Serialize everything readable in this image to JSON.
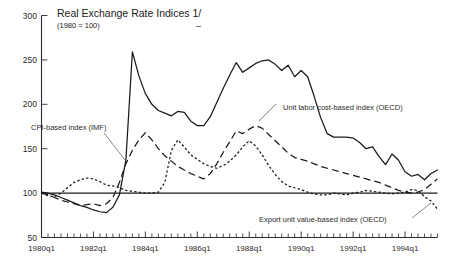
{
  "chart_data": {
    "type": "line",
    "title": "Real Exchange Rate Indices 1/",
    "subtitle": "(1980 = 100)",
    "xlabel": "",
    "ylabel": "",
    "ylim": [
      50,
      300
    ],
    "yticks": [
      50,
      100,
      150,
      200,
      250,
      300
    ],
    "grid": false,
    "legend_position": "inline-annotations",
    "reference_line": 100,
    "x_start": "1980q1",
    "x_end": "1995q2",
    "x_tick_labels": [
      "1980q1",
      "1982q1",
      "1984q1",
      "1986q1",
      "1988q1",
      "1990q1",
      "1992q1",
      "1994q1"
    ],
    "x_tick_indices": [
      0,
      8,
      16,
      24,
      32,
      40,
      48,
      56
    ],
    "x_all_quarters": [
      "1980q1",
      "1980q2",
      "1980q3",
      "1980q4",
      "1981q1",
      "1981q2",
      "1981q3",
      "1981q4",
      "1982q1",
      "1982q2",
      "1982q3",
      "1982q4",
      "1983q1",
      "1983q2",
      "1983q3",
      "1983q4",
      "1984q1",
      "1984q2",
      "1984q3",
      "1984q4",
      "1985q1",
      "1985q2",
      "1985q3",
      "1985q4",
      "1986q1",
      "1986q2",
      "1986q3",
      "1986q4",
      "1987q1",
      "1987q2",
      "1987q3",
      "1987q4",
      "1988q1",
      "1988q2",
      "1988q3",
      "1988q4",
      "1989q1",
      "1989q2",
      "1989q3",
      "1989q4",
      "1990q1",
      "1990q2",
      "1990q3",
      "1990q4",
      "1991q1",
      "1991q2",
      "1991q3",
      "1991q4",
      "1992q1",
      "1992q2",
      "1992q3",
      "1992q4",
      "1993q1",
      "1993q2",
      "1993q3",
      "1993q4",
      "1994q1",
      "1994q2",
      "1994q3",
      "1994q4",
      "1995q1",
      "1995q2"
    ],
    "series": [
      {
        "name": "Unit labor cost-based index (OECD)",
        "style": "solid",
        "annotation": "Unit labor cost-based index (OECD)",
        "values": [
          101,
          100,
          98,
          95,
          92,
          89,
          86,
          84,
          81,
          79,
          78,
          84,
          98,
          137,
          259,
          232,
          212,
          200,
          193,
          190,
          187,
          192,
          191,
          181,
          176,
          176,
          186,
          202,
          218,
          233,
          247,
          236,
          241,
          246,
          249,
          250,
          245,
          238,
          244,
          231,
          238,
          231,
          209,
          185,
          167,
          163,
          163,
          163,
          162,
          157,
          150,
          152,
          141,
          132,
          144,
          137,
          124,
          119,
          121,
          115,
          122,
          126
        ]
      },
      {
        "name": "CPI-based index (IMF)",
        "style": "dash",
        "annotation": "CPI-based index (IMF)",
        "values": [
          100,
          98,
          95,
          92,
          90,
          88,
          86,
          87,
          88,
          86,
          88,
          95,
          112,
          133,
          148,
          160,
          168,
          160,
          150,
          142,
          136,
          130,
          126,
          122,
          119,
          116,
          122,
          133,
          146,
          158,
          170,
          167,
          172,
          176,
          173,
          166,
          159,
          152,
          145,
          140,
          138,
          136,
          133,
          130,
          128,
          126,
          124,
          122,
          120,
          118,
          116,
          114,
          112,
          109,
          106,
          103,
          101,
          100,
          101,
          104,
          110,
          116
        ]
      },
      {
        "name": "Export unit value-based index (OECD)",
        "style": "dot",
        "annotation": "Export unit value-based index (OECD)",
        "values": [
          100,
          97,
          96,
          100,
          106,
          112,
          115,
          117,
          116,
          113,
          109,
          108,
          106,
          103,
          102,
          101,
          100,
          100,
          101,
          112,
          148,
          160,
          152,
          143,
          138,
          133,
          130,
          128,
          131,
          136,
          143,
          152,
          159,
          153,
          143,
          131,
          121,
          113,
          108,
          106,
          104,
          101,
          99,
          98,
          98,
          100,
          99,
          98,
          100,
          101,
          103,
          102,
          101,
          100,
          99,
          100,
          101,
          104,
          103,
          96,
          91,
          82
        ]
      }
    ]
  },
  "annotations": {
    "cpi": "CPI-based index (IMF)",
    "ulc": "Unit labor cost-based index (OECD)",
    "euv": "Export unit value-based index (OECD)"
  }
}
